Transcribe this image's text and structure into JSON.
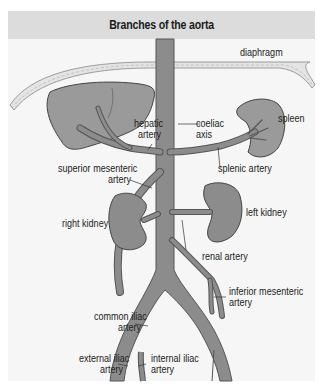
{
  "title": "Branches of the aorta",
  "colors": {
    "background": "#f6f6f6",
    "title_bar": "#dcdcdc",
    "vessel_fill": "#8c8c8c",
    "vessel_outline": "#555555",
    "organ_fill": "#9a9a9a",
    "diaphragm_fill": "#e4e4e4"
  },
  "labels": {
    "diaphragm": "diaphragm",
    "hepatic_artery_1": "hepatic",
    "hepatic_artery_2": "artery",
    "coeliac_axis_1": "coeliac",
    "coeliac_axis_2": "axis",
    "spleen": "spleen",
    "splenic_artery": "splenic artery",
    "superior_mesenteric_1": "superior mesenteric",
    "superior_mesenteric_2": "artery",
    "right_kidney": "right kidney",
    "left_kidney": "left kidney",
    "renal_artery": "renal artery",
    "inferior_mesenteric_1": "inferior mesenteric",
    "inferior_mesenteric_2": "artery",
    "common_iliac_1": "common iliac",
    "common_iliac_2": "artery",
    "external_iliac_1": "external iliac",
    "external_iliac_2": "artery",
    "internal_iliac_1": "internal iliac",
    "internal_iliac_2": "artery"
  }
}
